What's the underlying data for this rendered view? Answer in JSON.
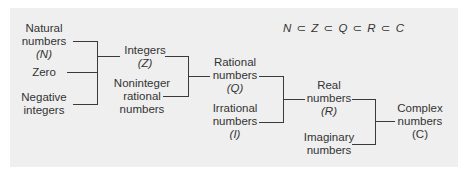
{
  "diagram": {
    "title_formula": "N ⊂ Z ⊂ Q ⊂ R ⊂ C",
    "nodes": {
      "natural": {
        "line1": "Natural",
        "line2": "numbers",
        "symbol": "(N)"
      },
      "zero": {
        "line1": "Zero"
      },
      "negative": {
        "line1": "Negative",
        "line2": "integers"
      },
      "integers": {
        "line1": "Integers",
        "symbol": "(Z)"
      },
      "noninteger": {
        "line1": "Noninteger",
        "line2": "rational",
        "line3": "numbers"
      },
      "rational": {
        "line1": "Rational",
        "line2": "numbers",
        "symbol": "(Q)"
      },
      "irrational": {
        "line1": "Irrational",
        "line2": "numbers",
        "symbol": "(I)"
      },
      "real": {
        "line1": "Real",
        "line2": "numbers",
        "symbol": "(R)"
      },
      "imaginary": {
        "line1": "Imaginary",
        "line2": "numbers"
      },
      "complex": {
        "line1": "Complex",
        "line2": "numbers",
        "symbol": "(C)"
      }
    },
    "edges": [
      {
        "from": [
          "natural",
          "zero",
          "negative"
        ],
        "to": "integers"
      },
      {
        "from": [
          "integers",
          "noninteger"
        ],
        "to": "rational"
      },
      {
        "from": [
          "rational",
          "irrational"
        ],
        "to": "real"
      },
      {
        "from": [
          "real",
          "imaginary"
        ],
        "to": "complex"
      }
    ],
    "colors": {
      "panel_bg": "#efefef",
      "text": "#333333",
      "line": "#3a3a3a"
    }
  }
}
